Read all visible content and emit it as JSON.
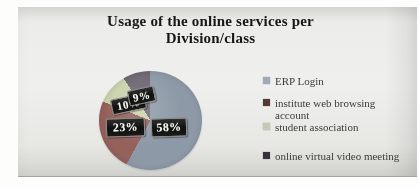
{
  "chart_data": {
    "type": "pie",
    "title": "Usage of the online services per Division/class",
    "title_lines": [
      "Usage of the online services per",
      "Division/class"
    ],
    "categories": [
      "ERP Login",
      "institute web browsing account",
      "student association",
      "online virtual video meeting"
    ],
    "values": [
      58,
      23,
      10,
      9
    ],
    "unit": "percent",
    "data_labels": [
      "58%",
      "23%",
      "10%",
      "9%"
    ],
    "slice_colors": [
      "#8c99a8",
      "#96605a",
      "#cbd2ab",
      "#6e6673"
    ],
    "legend_marker_colors": [
      "#9fabbb",
      "#553b38",
      "#c3c9b4",
      "#37313f"
    ],
    "legend_position": "right",
    "start_angle_deg": 0,
    "direction": "clockwise",
    "label_style": "black box, white bold text"
  }
}
